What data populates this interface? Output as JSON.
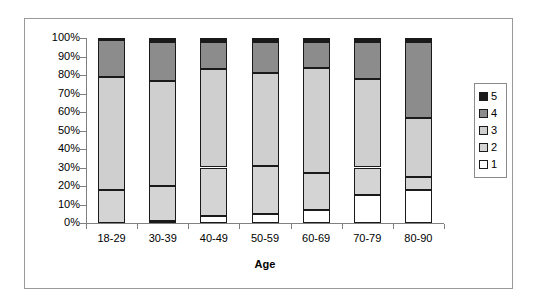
{
  "chart_data": {
    "type": "bar",
    "subtype": "100% stacked column",
    "title": "",
    "xlabel": "Age",
    "ylabel": "",
    "ylim": [
      0,
      100
    ],
    "y_tick_labels": [
      "100%",
      "90%",
      "80%",
      "70%",
      "60%",
      "50%",
      "40%",
      "30%",
      "20%",
      "10%",
      "0%"
    ],
    "y_tick_values": [
      100,
      90,
      80,
      70,
      60,
      50,
      40,
      30,
      20,
      10,
      0
    ],
    "grid": false,
    "legend_position": "right",
    "categories": [
      "18-29",
      "30-39",
      "40-49",
      "50-59",
      "60-69",
      "70-79",
      "80-90"
    ],
    "series": [
      {
        "name": "1",
        "color": "#ffffff",
        "values": [
          0,
          1,
          4,
          5,
          7,
          15,
          18
        ]
      },
      {
        "name": "2",
        "color": "#d4d4d4",
        "values": [
          18,
          19,
          26,
          26,
          20,
          15,
          7
        ]
      },
      {
        "name": "3",
        "color": "#cfcfcf",
        "values": [
          61,
          57,
          53,
          50,
          57,
          48,
          32
        ]
      },
      {
        "name": "4",
        "color": "#8c8c8c",
        "values": [
          20,
          21,
          15,
          17,
          14,
          20,
          41
        ]
      },
      {
        "name": "5",
        "color": "#1a1a1a",
        "values": [
          1,
          2,
          2,
          2,
          2,
          2,
          2
        ]
      }
    ],
    "legend_entries": [
      {
        "label": "5",
        "color": "#1a1a1a"
      },
      {
        "label": "4",
        "color": "#8c8c8c"
      },
      {
        "label": "3",
        "color": "#cfcfcf"
      },
      {
        "label": "2",
        "color": "#d4d4d4"
      },
      {
        "label": "1",
        "color": "#ffffff"
      }
    ]
  }
}
